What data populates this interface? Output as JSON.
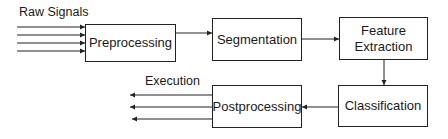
{
  "diagram": {
    "type": "flowchart",
    "input_label": "Raw Signals",
    "output_label": "Execution",
    "nodes": [
      {
        "id": "preprocessing",
        "label": "Preprocessing"
      },
      {
        "id": "segmentation",
        "label": "Segmentation"
      },
      {
        "id": "feature_extraction",
        "label_line1": "Feature",
        "label_line2": "Extraction"
      },
      {
        "id": "classification",
        "label": "Classification"
      },
      {
        "id": "postprocessing",
        "label": "Postprocessing"
      }
    ],
    "edges": [
      {
        "from": "raw_signals",
        "to": "preprocessing",
        "count": 4
      },
      {
        "from": "preprocessing",
        "to": "segmentation"
      },
      {
        "from": "segmentation",
        "to": "feature_extraction"
      },
      {
        "from": "feature_extraction",
        "to": "classification"
      },
      {
        "from": "classification",
        "to": "postprocessing"
      },
      {
        "from": "postprocessing",
        "to": "execution",
        "count": 3
      }
    ],
    "colors": {
      "stroke": "#222222",
      "background": "#ffffff"
    }
  }
}
